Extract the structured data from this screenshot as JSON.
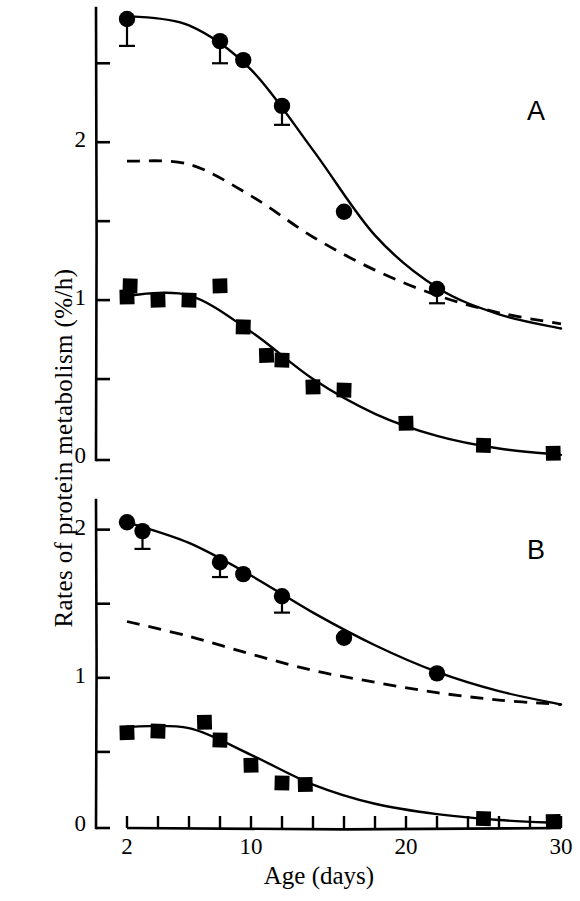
{
  "figure": {
    "xlabel": "Age (days)",
    "ylabel": "Rates of protein metabolism (%/h)",
    "panel_a_letter": "A",
    "panel_b_letter": "B",
    "ink_color": "#000000",
    "background_color": "#ffffff"
  },
  "axes": {
    "x_ticks_labeled": [
      "2",
      "10",
      "20",
      "30"
    ],
    "x_tick_values": [
      2,
      10,
      20,
      30
    ],
    "x_minor_tick_values": [
      2,
      4,
      6,
      8,
      10,
      12,
      14,
      16,
      18,
      20,
      22,
      24,
      26,
      28,
      30
    ],
    "panel_a_y_ticks_labeled": [
      "2",
      "1",
      "0"
    ],
    "panel_a_y_tick_values": [
      2,
      1,
      0
    ],
    "panel_a_y_minor_tick_values": [
      0,
      0.5,
      1,
      1.5,
      2,
      2.5
    ],
    "panel_b_y_ticks_labeled": [
      "2",
      "1",
      "0"
    ],
    "panel_b_y_tick_values": [
      2,
      1,
      0
    ],
    "panel_b_y_minor_tick_values": [
      0,
      0.5,
      1,
      1.5,
      2
    ]
  },
  "chart_data": [
    {
      "type": "scatter",
      "panel": "A",
      "title": "A",
      "xlabel": "Age (days)",
      "ylabel": "Rates of protein metabolism (%/h)",
      "xlim": [
        2,
        30
      ],
      "ylim": [
        0,
        2.85
      ],
      "grid": false,
      "legend": "none",
      "series": [
        {
          "name": "Protein synthesis (filled circles)",
          "marker": "circle",
          "line": "solid",
          "x": [
            2,
            8,
            9.5,
            12,
            16,
            22
          ],
          "y": [
            2.78,
            2.64,
            2.52,
            2.23,
            1.56,
            1.07
          ],
          "errors": [
            0.17,
            0.14,
            0.0,
            0.12,
            0.0,
            0.09
          ]
        },
        {
          "name": "Protein degradation (filled squares)",
          "marker": "square",
          "line": "solid",
          "x": [
            2,
            2.2,
            4,
            6,
            8,
            9.5,
            11,
            12,
            14,
            16,
            20,
            25,
            29.5
          ],
          "y": [
            1.02,
            1.09,
            1.0,
            1.0,
            1.09,
            0.83,
            0.65,
            0.62,
            0.45,
            0.43,
            0.22,
            0.08,
            0.03
          ],
          "errors": []
        },
        {
          "name": "Fitted curve synthesis",
          "marker": "none",
          "line": "solid",
          "x": [
            2,
            6,
            10,
            14,
            18,
            22,
            26,
            30
          ],
          "y": [
            2.8,
            2.74,
            2.46,
            1.95,
            1.41,
            1.08,
            0.91,
            0.82
          ]
        },
        {
          "name": "Fitted curve degradation",
          "marker": "none",
          "line": "solid",
          "x": [
            2,
            6,
            10,
            14,
            18,
            22,
            26,
            30
          ],
          "y": [
            1.03,
            1.03,
            0.8,
            0.5,
            0.28,
            0.14,
            0.06,
            0.02
          ]
        },
        {
          "name": "Reference (dashed)",
          "marker": "none",
          "line": "dashed",
          "x": [
            2,
            6,
            10,
            14,
            18,
            22,
            26,
            30
          ],
          "y": [
            1.88,
            1.86,
            1.66,
            1.4,
            1.19,
            1.03,
            0.92,
            0.85
          ]
        }
      ]
    },
    {
      "type": "scatter",
      "panel": "B",
      "title": "B",
      "xlabel": "Age (days)",
      "ylabel": "Rates of protein metabolism (%/h)",
      "xlim": [
        2,
        30
      ],
      "ylim": [
        0,
        2.2
      ],
      "grid": false,
      "legend": "none",
      "series": [
        {
          "name": "Protein synthesis (filled circles)",
          "marker": "circle",
          "line": "solid",
          "x": [
            2,
            3,
            8,
            9.5,
            12,
            16,
            22
          ],
          "y": [
            2.05,
            1.99,
            1.78,
            1.7,
            1.55,
            1.27,
            1.03
          ],
          "errors": [
            0.0,
            0.12,
            0.1,
            0.0,
            0.11,
            0.0,
            0.0
          ]
        },
        {
          "name": "Protein degradation (filled squares)",
          "marker": "square",
          "line": "solid",
          "x": [
            2,
            4,
            7,
            8,
            10,
            12,
            13.5,
            25,
            29.5
          ],
          "y": [
            0.63,
            0.64,
            0.7,
            0.58,
            0.41,
            0.29,
            0.28,
            0.05,
            0.03
          ],
          "errors": []
        },
        {
          "name": "Fitted curve synthesis",
          "marker": "none",
          "line": "solid",
          "x": [
            2,
            6,
            10,
            14,
            18,
            22,
            26,
            30
          ],
          "y": [
            2.05,
            1.91,
            1.69,
            1.44,
            1.22,
            1.04,
            0.91,
            0.82
          ]
        },
        {
          "name": "Fitted curve degradation",
          "marker": "none",
          "line": "solid",
          "x": [
            2,
            6,
            10,
            14,
            18,
            22,
            26,
            30
          ],
          "y": [
            0.67,
            0.66,
            0.48,
            0.28,
            0.15,
            0.08,
            0.04,
            0.02
          ]
        },
        {
          "name": "Reference (dashed)",
          "marker": "none",
          "line": "dashed",
          "x": [
            2,
            6,
            10,
            14,
            18,
            22,
            26,
            30
          ],
          "y": [
            1.38,
            1.28,
            1.16,
            1.05,
            0.97,
            0.9,
            0.85,
            0.82
          ]
        }
      ]
    }
  ]
}
